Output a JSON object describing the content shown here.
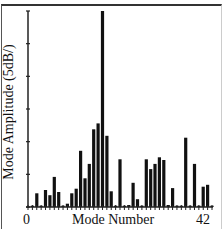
{
  "chart_data": {
    "type": "bar",
    "title": "",
    "xlabel": "Mode Number",
    "ylabel": "Mode Amplitude (5dB/)",
    "x_tick_labels": [
      "0",
      "42"
    ],
    "xlim": [
      0,
      42
    ],
    "ylim": [
      0,
      30
    ],
    "y_tick_step_db": 5,
    "grid": false,
    "legend": null,
    "colors": {
      "bar": "#111111",
      "axis": "#222222",
      "background": "#ffffff"
    },
    "categories": [
      1,
      2,
      3,
      4,
      5,
      6,
      7,
      8,
      9,
      10,
      11,
      12,
      13,
      14,
      15,
      16,
      17,
      18,
      19,
      20,
      21,
      22,
      23,
      24,
      25,
      26,
      27,
      28,
      29,
      30,
      31,
      32,
      33,
      34,
      35,
      36,
      37,
      38,
      39,
      40,
      41,
      42
    ],
    "values": [
      0.2,
      2.1,
      0.2,
      2.6,
      1.8,
      4.6,
      2.3,
      0.2,
      0.5,
      2.1,
      2.8,
      8.6,
      4.4,
      6.6,
      11.9,
      12.8,
      30.0,
      10.9,
      2.4,
      0.2,
      7.3,
      0.2,
      0.3,
      3.7,
      1.2,
      0.2,
      7.3,
      5.8,
      6.6,
      7.6,
      7.2,
      0.3,
      2.9,
      0.2,
      0.2,
      10.6,
      0.2,
      6.6,
      0.2,
      3.1,
      3.4,
      0.2
    ]
  }
}
